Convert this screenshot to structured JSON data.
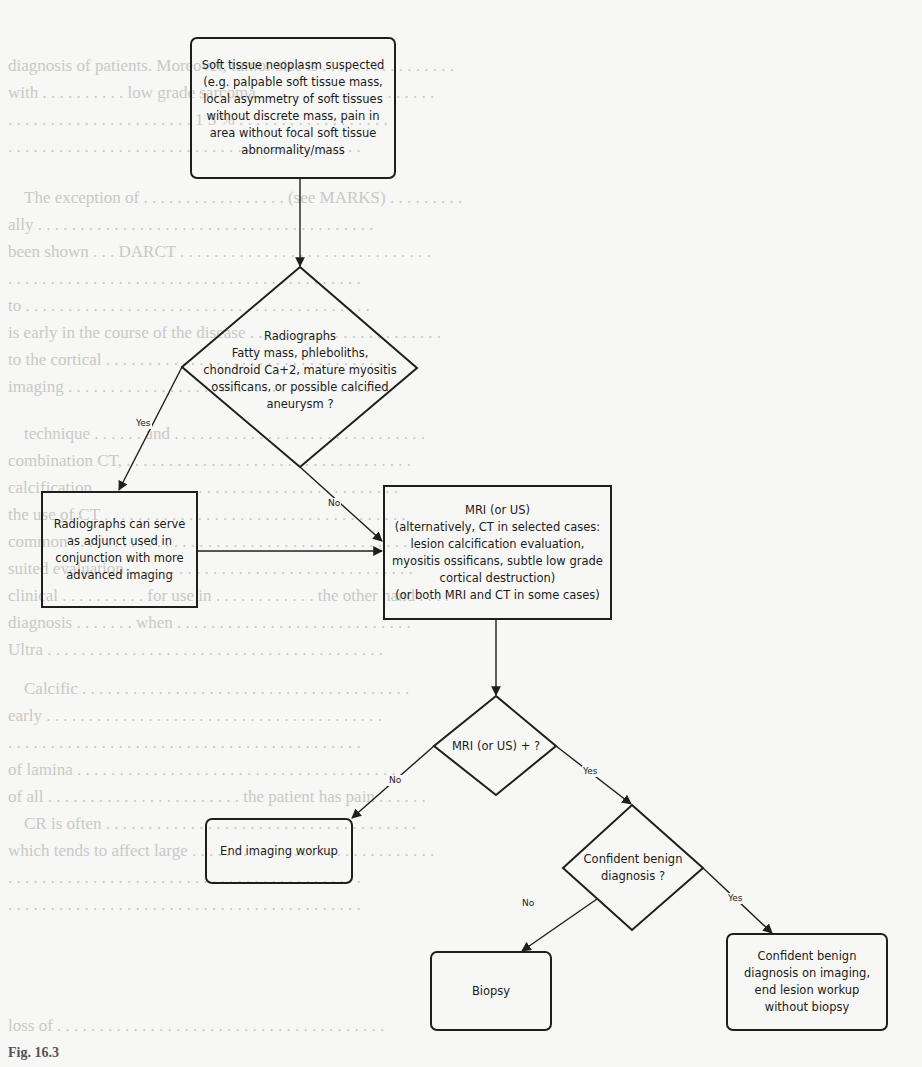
{
  "background_text": {
    "lines": [
      "diagnosis of patients. Moreover, tumor size is . . . . . . . . . . . . . . . .",
      "with . . . . . . . . . . low grade sarcoma . . . . . . . . . . . . . . . . . . . . .",
      ". . . . . . . . . . . . . . . . . . . . . . 1 5 % . . . . . . . . . . . . . . . . . .",
      ". . . . . . . . . . . . . . . . . . . . . . . . . . . . . . . . . . . . . . . . . .",
      "The exception of . . . . . . . . . . . . . . . . . (see MARKS) . . . . . . . . .",
      "ally . . . . . . . . . . . . . . . . . . . . . . . . . . . . . . . . . . . . . . . .",
      "been shown . . . DARCT . . . . . . . . . . . . . . . . . . . . . . . . . . . . . .",
      ". . . . . . . . . . . . . . . . . . . . . . . . . . . . . . . . . . . . . . . . . .",
      "to . . . . . . . . . . . . . . . . . . . . . . . . . . . . . . . . . . . . . . . . .",
      "is early in the course of the disease . . . . . . . . . . . . . . . . . . . . . . .",
      "to the cortical . . . . . . . . . . . . . . . . . . . . . . . . . . . . . . . . . .",
      "imaging . . . . . . . . . . . . . . . . . . . . . . . . . . . . . . . . . . . . . .",
      "technique . . . . . . and . . . . . . . . . . . . . . . . . . . . . . . . . . . . . .",
      "combination CT, . . . . . . . . . . . . . . . . . . . . . . . . . . . . . . . . . .",
      "calcification . . . . . . . . . . . . . . . . . . . . . . . . . . . . . . . . . . . .",
      "the use of CT . . . . . . . . . . . . . . . . . . . . . . . . . . . . . . . . . . . .",
      "common . . . . . . . . . . . . . . . . . . . . . . . . . . . . . . . . . . . . . . . .",
      "suited evaluation . . . . . . . . . . . . . . . . . . . . . . . . . . . . . . . . . .",
      "clinical . . . . . . . . . . for use in . . . . . . . . . . . . the other hand . . . .",
      "diagnosis . . . . . . . when . . . . . . . . . . . . . . . . . . . . . . . . . . . .",
      "Ultra . . . . . . . . . . . . . . . . . . . . . . . . . . . . . . . . . . . . . . . .",
      "Calcific . . . . . . . . . . . . . . . . . . . . . . . . . . . . . . . . . . . . . . .",
      "early . . . . . . . . . . . . . . . . . . . . . . . . . . . . . . . . . . . . . . . .",
      ". . . . . . . . . . . . . . . . . . . . . . . . . . . . . . . . . . . . . . . . . .",
      "of lamina . . . . . . . . . . . . . . . . . . . . . . . . . . . . . . . . . . . . . .",
      "of all . . . . . . . . . . . . . . . . . . . . . . . the patient has pain . . . . . .",
      "CR is often . . . . . . . . . . . . . . . . . . . . . . . . . . . . . . . . . . . . .",
      "which tends to affect large . . . . . . . . . . . . . . . . . . . . . . . . . . . . .",
      ". . . . . . . . . . . . . . . . . . . . . . . . . . . . . . . . . . . . . . . . . .",
      ". . . . . . . . . . . . . . . . . . . . . . . . . . . . . . . . . . . . . . . . . .",
      "loss of . . . . . . . . . . . . . . . . . . . . . . . . . . . . . . . . . . . . . . ."
    ],
    "figure_caption": "Fig. 16.3"
  },
  "flowchart": {
    "nodes": {
      "start": {
        "type": "rounded-box",
        "text": "Soft tissue neoplasm suspected\n(e.g. palpable soft tissue mass,\nlocal asymmetry of soft tissues\nwithout discrete mass, pain in\narea without focal soft tissue\nabnormality/mass"
      },
      "radiograph_decision": {
        "type": "diamond",
        "text": "Radiographs\nFatty mass, phleboliths,\nchondroid Ca+2, mature myositis\nossificans, or possible calcified\naneurysm ?"
      },
      "radiograph_adjunct": {
        "type": "box",
        "text": "Radiographs can serve\nas adjunct used in\nconjunction with more\nadvanced imaging"
      },
      "mri": {
        "type": "box",
        "text": "MRI (or US)\n(alternatively, CT in selected cases:\nlesion calcification evaluation,\nmyositis ossificans, subtle low grade\ncortical destruction)\n(or both MRI and CT in some cases)"
      },
      "mri_decision": {
        "type": "diamond",
        "text": "MRI (or US) + ?"
      },
      "end_workup": {
        "type": "rounded-box",
        "text": "End imaging workup"
      },
      "benign_decision": {
        "type": "diamond",
        "text": "Confident benign\ndiagnosis ?"
      },
      "biopsy": {
        "type": "rounded-box",
        "text": "Biopsy"
      },
      "benign_end": {
        "type": "rounded-box",
        "text": "Confident benign\ndiagnosis on imaging,\nend lesion workup\nwithout biopsy"
      }
    },
    "edges": [
      {
        "from": "start",
        "to": "radiograph_decision",
        "label": ""
      },
      {
        "from": "radiograph_decision",
        "to": "radiograph_adjunct",
        "label": "Yes"
      },
      {
        "from": "radiograph_decision",
        "to": "mri",
        "label": "No"
      },
      {
        "from": "radiograph_adjunct",
        "to": "mri",
        "label": ""
      },
      {
        "from": "mri",
        "to": "mri_decision",
        "label": ""
      },
      {
        "from": "mri_decision",
        "to": "end_workup",
        "label": "No"
      },
      {
        "from": "mri_decision",
        "to": "benign_decision",
        "label": "Yes"
      },
      {
        "from": "benign_decision",
        "to": "biopsy",
        "label": "No"
      },
      {
        "from": "benign_decision",
        "to": "benign_end",
        "label": "Yes"
      }
    ],
    "labels": {
      "yes": "Yes",
      "no": "No"
    }
  }
}
